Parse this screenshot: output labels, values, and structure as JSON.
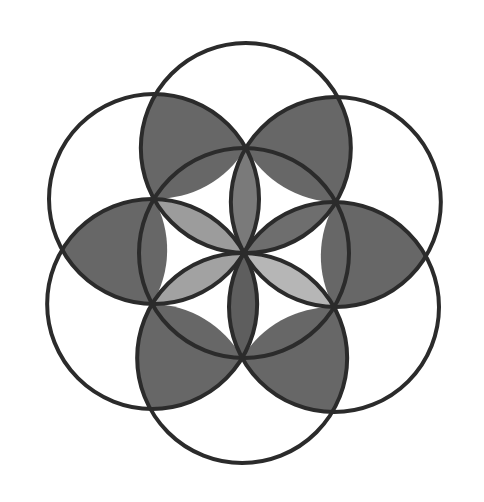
{
  "diagram": {
    "background": "#ffffff",
    "center": [
      244,
      253
    ],
    "radius": 105,
    "rotation_deg": 1,
    "stroke": {
      "color": "#2b2b2b",
      "width": 4
    },
    "circles": [
      {
        "name": "central-circle",
        "angle": null
      },
      {
        "name": "circle-right-upper",
        "angle": 30
      },
      {
        "name": "circle-top",
        "angle": 90
      },
      {
        "name": "circle-left-upper",
        "angle": 150
      },
      {
        "name": "circle-left-lower",
        "angle": 210
      },
      {
        "name": "circle-bottom",
        "angle": 270
      },
      {
        "name": "circle-right-lower",
        "angle": 330
      }
    ],
    "inner_petals": [
      {
        "name": "petal-top",
        "angle": 90,
        "fill": "#7a7a7a"
      },
      {
        "name": "petal-upper-right",
        "angle": 30,
        "fill": "#6e6e6e"
      },
      {
        "name": "petal-lower-right",
        "angle": 330,
        "fill": "#b6b6b6"
      },
      {
        "name": "petal-bottom",
        "angle": 270,
        "fill": "#5e5e5e"
      },
      {
        "name": "petal-lower-left",
        "angle": 210,
        "fill": "#a2a2a2"
      },
      {
        "name": "petal-upper-left",
        "angle": 150,
        "fill": "#9c9c9c"
      }
    ],
    "outer_regions": [
      {
        "name": "outer-region-upper-right",
        "angle": 60,
        "fill": "#676767"
      },
      {
        "name": "outer-region-upper-left",
        "angle": 120,
        "fill": "#676767"
      },
      {
        "name": "outer-region-left",
        "angle": 180,
        "fill": "#676767"
      },
      {
        "name": "outer-region-lower-left",
        "angle": 240,
        "fill": "#676767"
      },
      {
        "name": "outer-region-lower-right",
        "angle": 300,
        "fill": "#676767"
      },
      {
        "name": "outer-region-right",
        "angle": 0,
        "fill": "#676767"
      }
    ]
  }
}
